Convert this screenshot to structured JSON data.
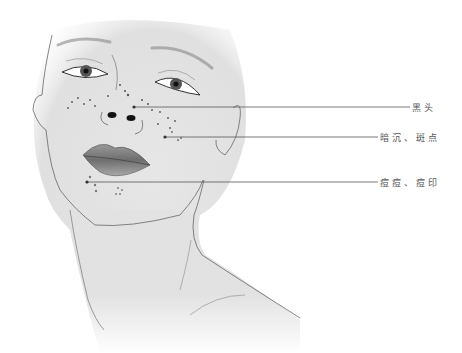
{
  "figure": {
    "annotations": [
      {
        "label": "黑头",
        "point": [
          134,
          107
        ],
        "line_end_x": 410,
        "label_x": 412,
        "label_y": 101
      },
      {
        "label": "暗沉、斑点",
        "point": [
          165,
          137
        ],
        "line_end_x": 378,
        "label_x": 380,
        "label_y": 131
      },
      {
        "label": "痘痘、痘印",
        "point": [
          87,
          182
        ],
        "line_end_x": 378,
        "label_x": 380,
        "label_y": 176
      }
    ]
  },
  "colors": {
    "skin": "#e4e4e4",
    "outline": "#555555",
    "annotation_line": "#555555",
    "label_text": "#555555",
    "lips": "#8a8a8a"
  }
}
